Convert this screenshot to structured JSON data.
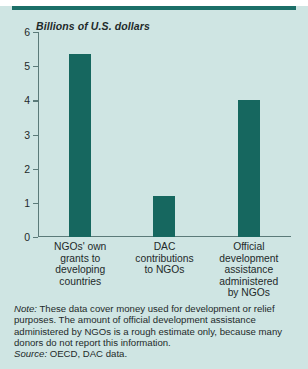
{
  "chart_data": {
    "type": "bar",
    "title": "",
    "ylabel": "Billions of U.S. dollars",
    "xlabel": "",
    "ylim": [
      0,
      6
    ],
    "yticks": [
      0,
      1,
      2,
      3,
      4,
      5,
      6
    ],
    "grid": false,
    "legend": null,
    "bar_color": "#16675f",
    "background_color": "#cfe5e3",
    "categories": [
      "NGOs' own grants to developing countries",
      "DAC contributions to NGOs",
      "Official development assistance administered by NGOs"
    ],
    "category_lines": [
      [
        "NGOs' own",
        "grants to",
        "developing",
        "countries"
      ],
      [
        "DAC",
        "contributions",
        "to NGOs"
      ],
      [
        "Official",
        "development",
        "assistance",
        "administered",
        "by NGOs"
      ]
    ],
    "values": [
      5.35,
      1.2,
      4.0
    ]
  },
  "axis": {
    "y_title": "Billions of U.S. dollars",
    "tick_labels": [
      "6",
      "5",
      "4",
      "3",
      "2",
      "1",
      "0"
    ]
  },
  "footnote": {
    "note_label": "Note:",
    "note_text": " These data cover money used for development or relief purposes. The amount of official development assistance administered by NGOs is a rough estimate only, because many donors do not report this information.",
    "source_label": "Source:",
    "source_text": " OECD, DAC data."
  }
}
